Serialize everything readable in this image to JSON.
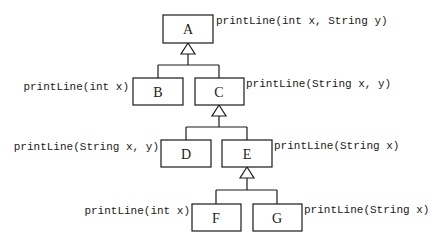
{
  "diagram": {
    "type": "uml-class-inheritance",
    "classes": [
      {
        "name": "A",
        "method": "printLine(int x, String y)"
      },
      {
        "name": "B",
        "method": "printLine(int x)"
      },
      {
        "name": "C",
        "method": "printLine(String x, y)"
      },
      {
        "name": "D",
        "method": "printLine(String x, y)"
      },
      {
        "name": "E",
        "method": "printLine(String x)"
      },
      {
        "name": "F",
        "method": "printLine(int x)"
      },
      {
        "name": "G",
        "method": "printLine(String x)"
      }
    ],
    "inheritance": [
      {
        "parent": "A",
        "children": [
          "B",
          "C"
        ]
      },
      {
        "parent": "C",
        "children": [
          "D",
          "E"
        ]
      },
      {
        "parent": "E",
        "children": [
          "F",
          "G"
        ]
      }
    ]
  }
}
